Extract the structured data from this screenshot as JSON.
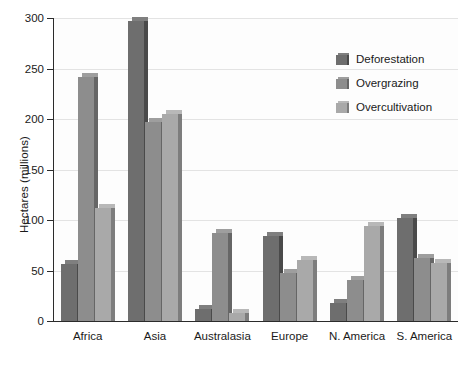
{
  "chart_data": {
    "type": "bar",
    "title": "",
    "subtitle": "",
    "xlabel": "",
    "ylabel": "Hectares (millions)",
    "ylim": [
      0,
      300
    ],
    "yticks": [
      0,
      50,
      100,
      150,
      200,
      250,
      300
    ],
    "ytick_labels": [
      "0",
      "50",
      "100",
      "150",
      "200",
      "250",
      "300"
    ],
    "grid": true,
    "grid_axis": "y",
    "legend_position": "upper-right",
    "categories": [
      "Africa",
      "Asia",
      "Australasia",
      "Europe",
      "N. America",
      "S. America"
    ],
    "series": [
      {
        "name": "Deforestation",
        "color": "#6e6e6e",
        "side_color": "#4a4a4a",
        "top_color": "#7f7f7f",
        "values": [
          56,
          297,
          12,
          84,
          18,
          102
        ]
      },
      {
        "name": "Overgrazing",
        "color": "#8d8d8d",
        "side_color": "#666666",
        "top_color": "#9e9e9e",
        "values": [
          242,
          197,
          87,
          48,
          41,
          62
        ]
      },
      {
        "name": "Overcultivation",
        "color": "#a9a9a9",
        "side_color": "#7d7d7d",
        "top_color": "#b8b8b8",
        "values": [
          112,
          205,
          8,
          60,
          94,
          57
        ]
      }
    ],
    "annotations": []
  },
  "legend": {
    "items": [
      {
        "label": "Deforestation"
      },
      {
        "label": "Overgrazing"
      },
      {
        "label": "Overcultivation"
      }
    ]
  },
  "axes": {
    "y_title": "Hectares (millions)"
  },
  "colors": {
    "axis": "#2b2b2b",
    "grid": "#e3e3e3",
    "text": "#1a1a1a",
    "background": "#ffffff",
    "plot_background": "#fdfdfd"
  }
}
